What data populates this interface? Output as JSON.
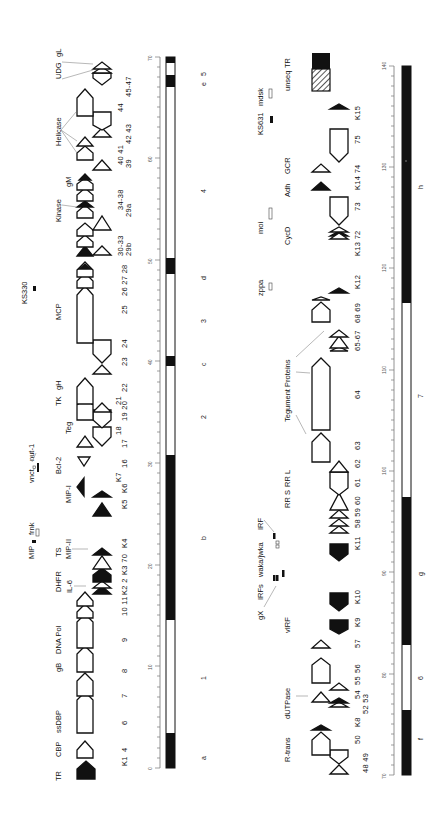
{
  "figure": {
    "orientation": "rotated 90 degrees counterclockwise",
    "panels": [
      {
        "id": "left",
        "range_kb": [
          0,
          70
        ],
        "axis_ticks": [
          "0",
          "10",
          "20",
          "30",
          "40",
          "50",
          "60",
          "70"
        ],
        "bar_segments": [
          {
            "from": 0,
            "to": 3.5,
            "fill": "black"
          },
          {
            "from": 3.5,
            "to": 14.5,
            "fill": "white"
          },
          {
            "from": 14.5,
            "to": 30.8,
            "fill": "black"
          },
          {
            "from": 30.8,
            "to": 39.5,
            "fill": "white"
          },
          {
            "from": 39.5,
            "to": 40.5,
            "fill": "black"
          },
          {
            "from": 40.5,
            "to": 48.2,
            "fill": "white"
          },
          {
            "from": 48.2,
            "to": 49.8,
            "fill": "black"
          },
          {
            "from": 49.8,
            "to": 67,
            "fill": "white"
          },
          {
            "from": 67,
            "to": 68.2,
            "fill": "black"
          },
          {
            "from": 68.2,
            "to": 69.4,
            "fill": "white"
          },
          {
            "from": 69.4,
            "to": 70,
            "fill": "black"
          }
        ],
        "region_labels": [
          {
            "text": "a",
            "pos": 1
          },
          {
            "text": "1",
            "pos": 9
          },
          {
            "text": "b",
            "pos": 23
          },
          {
            "text": "2",
            "pos": 35
          },
          {
            "text": "c",
            "pos": 40
          },
          {
            "text": "3",
            "pos": 44.5
          },
          {
            "text": "d",
            "pos": 49
          },
          {
            "text": "4",
            "pos": 57
          },
          {
            "text": "e",
            "pos": 67.6
          },
          {
            "text": "5",
            "pos": 68.4
          }
        ],
        "orf_numbers": [
          "K1",
          "4",
          "6",
          "7",
          "8",
          "9",
          "10",
          "11",
          "K2",
          "2",
          "K3",
          "70",
          "K4",
          "K5",
          "K6",
          "K7",
          "16",
          "17",
          "18",
          "19",
          "20",
          "21",
          "22",
          "23",
          "24",
          "25",
          "26",
          "27",
          "28",
          "29b",
          "30-33",
          "29a",
          "34-38",
          "39",
          "40",
          "41",
          "42",
          "43",
          "44",
          "45-47"
        ],
        "gene_labels": [
          "TR",
          "CBP",
          "ssDBP",
          "gB",
          "DNA Pol",
          "DHFR",
          "IL-6",
          "TS",
          "MIP-II",
          "MIP",
          "frnk",
          "MIP-I",
          "vnct",
          "nut-1",
          "Bcl-2",
          "Teg",
          "TK",
          "gH",
          "MCP",
          "KS330",
          "Kinase",
          "gM",
          "Helicase",
          "UDG",
          "gL"
        ]
      },
      {
        "id": "right",
        "range_kb": [
          70,
          140
        ],
        "axis_ticks": [
          "70",
          "80",
          "90",
          "100",
          "110",
          "120",
          "130",
          "140"
        ],
        "bar_segments": [
          {
            "from": 70,
            "to": 76.5,
            "fill": "black"
          },
          {
            "from": 76.5,
            "to": 82.7,
            "fill": "white"
          },
          {
            "from": 82.7,
            "to": 97,
            "fill": "black"
          },
          {
            "from": 97,
            "to": 116.6,
            "fill": "white"
          },
          {
            "from": 116.6,
            "to": 140,
            "fill": "black"
          }
        ],
        "region_labels": [
          {
            "text": "f",
            "pos": 73.5
          },
          {
            "text": "6",
            "pos": 80
          },
          {
            "text": "g",
            "pos": 90
          },
          {
            "text": "7",
            "pos": 107
          },
          {
            "text": "h",
            "pos": 128
          }
        ],
        "orf_numbers": [
          "48",
          "49",
          "50",
          "K8",
          "52",
          "53",
          "54",
          "55",
          "56",
          "57",
          "K9",
          "K10",
          "K11",
          "58",
          "59",
          "60",
          "61",
          "62",
          "63",
          "64",
          "65-67",
          "68",
          "69",
          "K12",
          "K13",
          "72",
          "73",
          "K14",
          "74",
          "75",
          "K15"
        ],
        "gene_labels": [
          "R-trans",
          "dUTPase",
          "vIRF",
          "gX",
          "IRFs",
          "waka/jwka",
          "IRF",
          "RR S",
          "RR L",
          "Tegument Proteins",
          "zppa",
          "moi",
          "CycD",
          "Adh",
          "GCR",
          "KS631",
          "mdsk",
          "unseq",
          "TR"
        ]
      }
    ]
  },
  "L": {
    "t0": "0",
    "t10": "10",
    "t20": "20",
    "t30": "30",
    "t40": "40",
    "t50": "50",
    "t60": "60",
    "t70": "70",
    "ra": "a",
    "r1": "1",
    "rb": "b",
    "r2": "2",
    "rc": "c",
    "r3": "3",
    "rd": "d",
    "r4": "4",
    "re": "e",
    "r5": "5",
    "TR": "TR",
    "CBP": "CBP",
    "ssDBP": "ssDBP",
    "gB": "gB",
    "DNAPol": "DNA Pol",
    "DHFR": "DHFR",
    "IL6": "IL-6",
    "TS": "TS",
    "MIPII": "MIP-II",
    "MIP": "MIP",
    "frnk": "frnk",
    "MIPI": "MIP-I",
    "vnct": "vnct",
    "nut1": "nut-1",
    "Bcl2": "Bcl-2",
    "Teg": "Teg",
    "TK": "TK",
    "gH": "gH",
    "MCP": "MCP",
    "KS330": "KS330",
    "Kinase": "Kinase",
    "gM": "gM",
    "Helicase": "Helicase",
    "UDG": "UDG",
    "gL": "gL",
    "n_K1": "K1",
    "n_4": "4",
    "n_6": "6",
    "n_7": "7",
    "n_8": "8",
    "n_9": "9",
    "n_1011": "10 11",
    "n_K22": "K2 2",
    "n_K370": "K3 70",
    "n_K4": "K4",
    "n_K5": "K5",
    "n_K6": "K6",
    "n_K7": "K7",
    "n_16": "16",
    "n_17": "17",
    "n_18": "18",
    "n_1920": "19 20",
    "n_21": "21",
    "n_22": "22",
    "n_23": "23",
    "n_24": "24",
    "n_25": "25",
    "n_262728": "26 27 28",
    "n_29b": "29b",
    "n_3033": "30-33",
    "n_29a": "29a",
    "n_3438": "34-38",
    "n_39": "39",
    "n_4041": "40 41",
    "n_4243": "42 43",
    "n_44": "44",
    "n_4547": "45-47"
  },
  "R": {
    "t70": "70",
    "t80": "80",
    "t90": "90",
    "t100": "100",
    "t110": "110",
    "t120": "120",
    "t130": "130",
    "t140": "140",
    "rf": "f",
    "r6": "6",
    "rg": "g",
    "r7": "7",
    "rh": "h",
    "Rtrans": "R-trans",
    "dUTPase": "dUTPase",
    "vIRF": "vIRF",
    "gX": "gX",
    "IRFs": "IRFs",
    "waka": "waka/jwka",
    "IRF": "IRF",
    "RRS": "RR S",
    "RRL": "RR L",
    "Teg": "Tegument Proteins",
    "zppa": "zppa",
    "moi": "moi",
    "CycD": "CycD",
    "Adh": "Adh",
    "GCR": "GCR",
    "KS631": "KS631",
    "mdsk": "mdsk",
    "unseq": "unseq",
    "TR": "TR",
    "n_4849": "48 49",
    "n_50": "50",
    "n_K8": "K8",
    "n_5253": "52 53",
    "n_54": "54",
    "n_55": "55",
    "n_56": "56",
    "n_57": "57",
    "n_K9": "K9",
    "n_K10": "K10",
    "n_K11": "K11",
    "n_5859": "58 59",
    "n_60": "60",
    "n_61": "61",
    "n_62": "62",
    "n_63": "63",
    "n_64": "64",
    "n_6567": "65-67",
    "n_6869": "68 69",
    "n_K12": "K12",
    "n_K1372": "K13 72",
    "n_73": "73",
    "n_K1474": "K14 74",
    "n_75": "75",
    "n_K15": "K15"
  }
}
